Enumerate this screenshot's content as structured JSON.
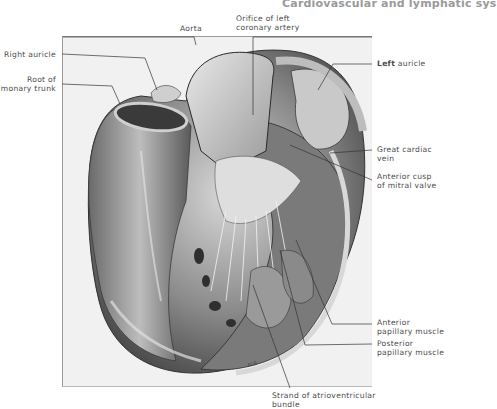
{
  "page": {
    "running_header": "Cardiovascular and lymphatic sys"
  },
  "figure": {
    "artist_signature": "ALB",
    "labels": {
      "aorta": "Aorta",
      "orifice_left_coronary_1": "Orifice of left",
      "orifice_left_coronary_2": "coronary artery",
      "right_auricle": "Right auricle",
      "root_pulmonary_1": "Root of",
      "root_pulmonary_2": "monary trunk",
      "left_auricle_bold": "Left",
      "left_auricle_rest": " auricle",
      "great_cardiac_1": "Great cardiac",
      "great_cardiac_2": "vein",
      "anterior_cusp_1": "Anterior cusp",
      "anterior_cusp_2": "of mitral valve",
      "anterior_papillary_1": "Anterior",
      "anterior_papillary_2": "papillary muscle",
      "posterior_papillary_1": "Posterior",
      "posterior_papillary_2": "papillary muscle",
      "strand_av_1": "Strand of atrioventricular",
      "strand_av_2": "bundle"
    }
  }
}
